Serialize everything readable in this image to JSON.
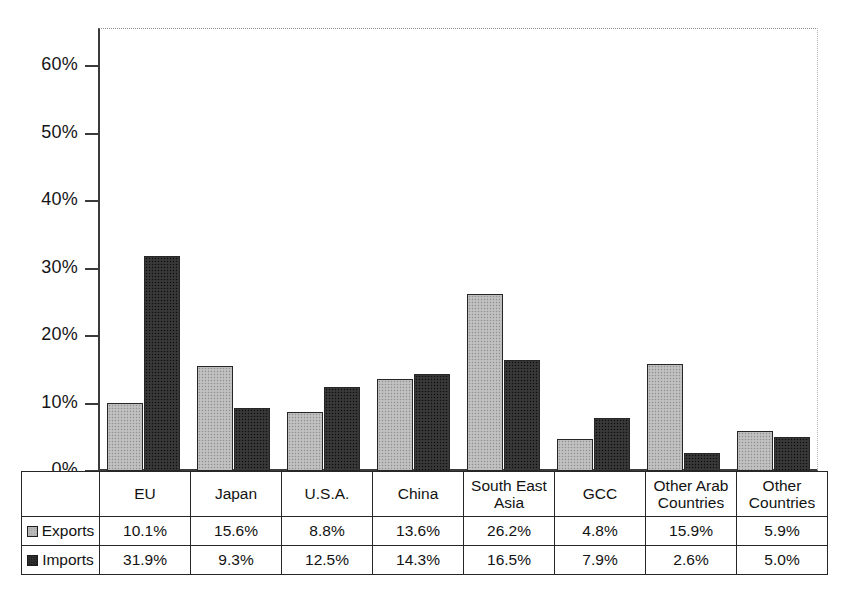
{
  "chart_data": {
    "type": "bar",
    "title": "",
    "xlabel": "",
    "ylabel": "",
    "ylim": [
      0,
      65
    ],
    "ytick_labels": [
      "0%",
      "10%",
      "20%",
      "30%",
      "40%",
      "50%",
      "60%"
    ],
    "ytick_values": [
      0,
      10,
      20,
      30,
      40,
      50,
      60
    ],
    "grid": false,
    "legend_position": "table-left",
    "categories": [
      "EU",
      "Japan",
      "U.S.A.",
      "China",
      "South East Asia",
      "GCC",
      "Other Arab Countries",
      "Other Countries"
    ],
    "category_lines": [
      [
        "EU"
      ],
      [
        "Japan"
      ],
      [
        "U.S.A."
      ],
      [
        "China"
      ],
      [
        "South East",
        "Asia"
      ],
      [
        "GCC"
      ],
      [
        "Other Arab",
        "Countries"
      ],
      [
        "Other",
        "Countries"
      ]
    ],
    "series": [
      {
        "name": "Exports",
        "color": "#b9b9b9",
        "values": [
          10.1,
          15.6,
          8.8,
          13.6,
          26.2,
          4.8,
          15.9,
          5.9
        ],
        "labels": [
          "10.1%",
          "15.6%",
          "8.8%",
          "13.6%",
          "26.2%",
          "4.8%",
          "15.9%",
          "5.9%"
        ]
      },
      {
        "name": "Imports",
        "color": "#323232",
        "values": [
          31.9,
          9.3,
          12.5,
          14.3,
          16.5,
          7.9,
          2.6,
          5.0
        ],
        "labels": [
          "31.9%",
          "9.3%",
          "12.5%",
          "14.3%",
          "16.5%",
          "7.9%",
          "2.6%",
          "5.0%"
        ]
      }
    ]
  },
  "legend": {
    "items": [
      {
        "label": "Exports",
        "swatch": "exports-swatch-icon"
      },
      {
        "label": "Imports",
        "swatch": "imports-swatch-icon"
      }
    ]
  }
}
